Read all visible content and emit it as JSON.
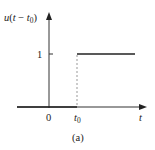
{
  "figure": {
    "y_axis_label": {
      "func": "u",
      "arg_var": "t",
      "minus": "−",
      "arg_sub_var": "t",
      "arg_sub": "0"
    },
    "x_axis_label": "t",
    "y_tick_label": "1",
    "origin_label": "0",
    "step_label": {
      "var": "t",
      "sub": "0"
    },
    "caption": "(a)"
  },
  "colors": {
    "line": "#222222",
    "dotted": "#999999"
  }
}
